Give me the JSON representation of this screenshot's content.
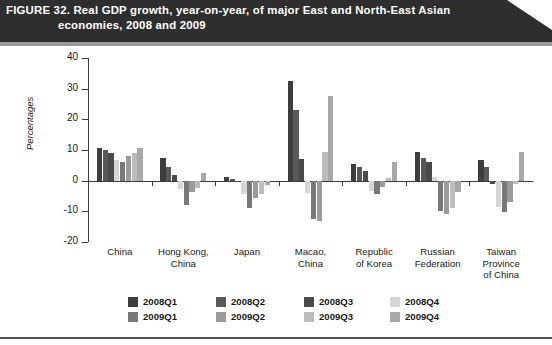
{
  "banner": {
    "figure_number": "FIGURE 32.",
    "title_line1": "Real GDP growth, year-on-year, of major East and North-East Asian",
    "title_line2": "economies, 2008 and 2009"
  },
  "chart_data": {
    "type": "bar",
    "title": "Real GDP growth, year-on-year, of major East and North-East Asian economies, 2008 and 2009",
    "xlabel": "",
    "ylabel": "Percentages",
    "ylim": [
      -20,
      40
    ],
    "yticks": [
      40,
      30,
      20,
      10,
      0,
      -10,
      -20
    ],
    "ytick_labels": [
      "40",
      "30",
      "20",
      "10",
      "0",
      "-10",
      "-20"
    ],
    "grid": false,
    "legend_position": "bottom",
    "categories": [
      "China",
      "Hong Kong, China",
      "Japan",
      "Macao, China",
      "Republic of Korea",
      "Russian Federation",
      "Taiwan Province of China"
    ],
    "category_lines": [
      [
        "China"
      ],
      [
        "Hong Kong,",
        "China"
      ],
      [
        "Japan"
      ],
      [
        "Macao,",
        "China"
      ],
      [
        "Republic",
        "of Korea"
      ],
      [
        "Russian",
        "Federation"
      ],
      [
        "Taiwan",
        "Province",
        "of China"
      ]
    ],
    "series": [
      {
        "name": "2008Q1",
        "color": "#3d3d3d",
        "values": [
          10.6,
          7.3,
          1.3,
          32.5,
          5.5,
          9.2,
          6.9
        ]
      },
      {
        "name": "2008Q2",
        "color": "#595959",
        "values": [
          10.1,
          4.3,
          0.6,
          23.0,
          4.3,
          7.5,
          4.6
        ]
      },
      {
        "name": "2008Q3",
        "color": "#4a4a4a",
        "values": [
          9.0,
          1.7,
          -0.3,
          7.0,
          3.1,
          6.0,
          -1.0
        ]
      },
      {
        "name": "2008Q4",
        "color": "#d6d6d6",
        "values": [
          6.8,
          -2.6,
          -4.5,
          -4.0,
          -3.4,
          1.2,
          -8.6
        ]
      },
      {
        "name": "2009Q1",
        "color": "#787878",
        "values": [
          6.1,
          -7.8,
          -8.8,
          -12.5,
          -4.2,
          -9.8,
          -10.1
        ]
      },
      {
        "name": "2009Q2",
        "color": "#9b9b9b",
        "values": [
          7.9,
          -3.6,
          -5.7,
          -13.0,
          -2.2,
          -10.9,
          -7.1
        ]
      },
      {
        "name": "2009Q3",
        "color": "#bdbdbd",
        "values": [
          9.1,
          -2.4,
          -4.5,
          9.5,
          0.9,
          -8.9,
          -1.2
        ]
      },
      {
        "name": "2009Q4",
        "color": "#a8a8a8",
        "values": [
          10.7,
          2.6,
          -1.4,
          27.5,
          6.0,
          -3.8,
          9.2
        ]
      }
    ]
  },
  "legend": {
    "items": [
      {
        "label": "2008Q1",
        "color": "#3d3d3d"
      },
      {
        "label": "2008Q2",
        "color": "#595959"
      },
      {
        "label": "2008Q3",
        "color": "#4a4a4a"
      },
      {
        "label": "2008Q4",
        "color": "#d6d6d6"
      },
      {
        "label": "2009Q1",
        "color": "#787878"
      },
      {
        "label": "2009Q2",
        "color": "#9b9b9b"
      },
      {
        "label": "2009Q3",
        "color": "#bdbdbd"
      },
      {
        "label": "2009Q4",
        "color": "#a8a8a8"
      }
    ]
  }
}
